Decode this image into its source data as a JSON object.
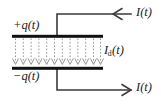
{
  "figure": {
    "background_color": "#ffffff",
    "stroke_color": "#1a1a1a",
    "plate_color": "#111111",
    "dashed_field_color": "#777777",
    "labels": {
      "top_plate_charge": "+q(t)",
      "bottom_plate_charge": "−q(t)",
      "displacement_current_symbol": "I",
      "displacement_current_subscript": "d",
      "displacement_current_argument": "(t)",
      "current_top": "I(t)",
      "current_bottom": "I(t)"
    },
    "geometry": {
      "plate_left_x": 12,
      "plate_right_x": 103,
      "top_plate_y": 36,
      "bottom_plate_y": 68,
      "plate_thickness": 3,
      "lead_x": 57,
      "top_lead_y": 14,
      "bottom_lead_y": 90,
      "lead_right_x": 131,
      "field_line_count": 12
    },
    "arrows": {
      "top_direction": "left",
      "bottom_direction": "right",
      "field_direction": "down",
      "head_style": "open-v"
    }
  }
}
